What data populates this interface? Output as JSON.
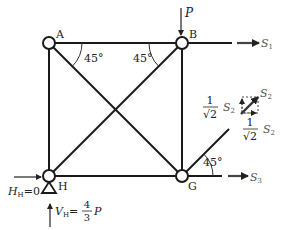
{
  "diagram": {
    "type": "truss",
    "nodes": [
      {
        "id": "A",
        "label": "A",
        "x": 49,
        "y": 43
      },
      {
        "id": "B",
        "label": "B",
        "x": 182,
        "y": 43
      },
      {
        "id": "H",
        "label": "H",
        "x": 49,
        "y": 176
      },
      {
        "id": "G",
        "label": "G",
        "x": 182,
        "y": 176
      }
    ],
    "members": [
      [
        "A",
        "B"
      ],
      [
        "A",
        "H"
      ],
      [
        "B",
        "G"
      ],
      [
        "H",
        "G"
      ],
      [
        "A",
        "G"
      ],
      [
        "H",
        "B"
      ]
    ],
    "angles": {
      "a1": "45°",
      "a2": "45°",
      "a3": "45°"
    },
    "loads": {
      "P": "P",
      "S1": "S",
      "S1_sub": "1",
      "S2": "S",
      "S2_sub": "2",
      "S3": "S",
      "S3_sub": "3"
    },
    "components": {
      "frac_num": "1",
      "frac_den": "√2",
      "comp_label": "S",
      "comp_sub": "2"
    },
    "reactions": {
      "H_label": "H",
      "H_sub": "H",
      "H_value": "=0",
      "V_label": "V",
      "V_sub": "H",
      "V_eq": "=",
      "V_num": "4",
      "V_den": "3",
      "V_P": "P"
    },
    "colors": {
      "line": "#1a1a1a",
      "arrow": "#333333",
      "label": "#222222"
    }
  }
}
